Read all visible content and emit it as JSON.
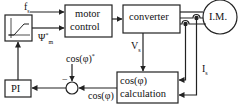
{
  "blocks": {
    "ramp": {
      "label": ""
    },
    "motor_control": {
      "line1": "motor",
      "line2": "control"
    },
    "converter": {
      "label": "converter"
    },
    "motor": {
      "label": "I.M."
    },
    "pi": {
      "label": "PI"
    },
    "cos_calc": {
      "line1": "cos(φ)",
      "line2": "calculation"
    },
    "sum": {
      "sign": "−"
    }
  },
  "signals": {
    "fs": "f",
    "fs_sub": "s",
    "psi": "Ψ",
    "psi_sup": "*",
    "psi_sub": "m",
    "vs": "V",
    "vs_sub": "s",
    "is": "I",
    "is_sub": "s",
    "cos_ref": "cos(φ)",
    "cos_ref_sup": "*",
    "cos_fb": "cos(φ)"
  },
  "colors": {
    "line": "#222222",
    "background": "#ffffff"
  }
}
